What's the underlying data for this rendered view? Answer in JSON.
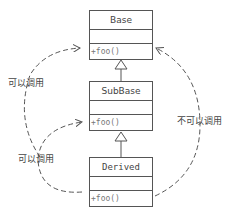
{
  "diagram": {
    "classes": [
      {
        "name": "Base",
        "operation": "+foo()"
      },
      {
        "name": "SubBase",
        "operation": "+foo()"
      },
      {
        "name": "Derived",
        "operation": "+foo()"
      }
    ],
    "annotations": {
      "subbase_to_base": "可以调用",
      "derived_to_subbase": "可以调用",
      "derived_to_base": "不可以调用"
    },
    "colors": {
      "line": "#555555",
      "text": "#444444"
    }
  }
}
